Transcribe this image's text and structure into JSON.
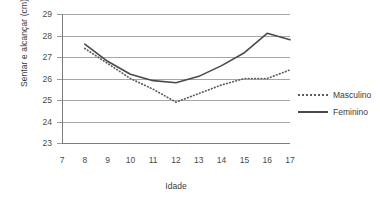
{
  "chart_data": {
    "type": "line",
    "title": "",
    "xlabel": "Idade",
    "ylabel": "Sentar e alcançar (cm)",
    "xlim": [
      7,
      17
    ],
    "ylim": [
      23,
      29
    ],
    "xticks": [
      "7",
      "8",
      "9",
      "10",
      "11",
      "12",
      "13",
      "14",
      "15",
      "16",
      "17"
    ],
    "yticks": [
      "23",
      "24",
      "25",
      "26",
      "27",
      "28",
      "29"
    ],
    "grid": true,
    "legend_position": "right",
    "x": [
      8,
      9,
      10,
      11,
      12,
      13,
      14,
      15,
      16,
      17
    ],
    "series": [
      {
        "name": "Masculino",
        "style": "dotted",
        "color": "#5c5c5c",
        "values": [
          27.4,
          26.7,
          26.0,
          25.5,
          24.9,
          25.3,
          25.7,
          26.0,
          26.0,
          26.4
        ]
      },
      {
        "name": "Feminino",
        "style": "solid",
        "color": "#4a4a4a",
        "values": [
          27.6,
          26.8,
          26.2,
          25.9,
          25.8,
          26.1,
          26.6,
          27.2,
          28.1,
          27.8
        ]
      }
    ]
  },
  "legend": {
    "items": [
      {
        "label": "Masculino"
      },
      {
        "label": "Feminino"
      }
    ]
  },
  "colors": {
    "grid": "#a6a6a6",
    "axis": "#7d7d7d",
    "text": "#3b3b3b",
    "background": "#ffffff"
  }
}
